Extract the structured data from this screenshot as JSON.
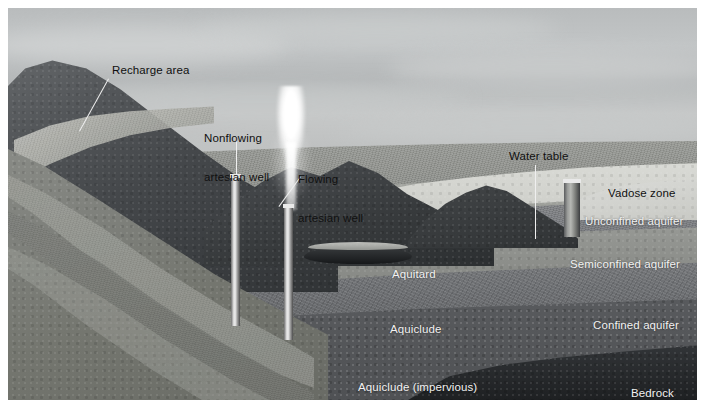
{
  "figure": {
    "kind": "groundwater-cross-section",
    "style": "grayscale-airbrush-illustration",
    "plate_bounds": {
      "left": 8,
      "top": 8,
      "width": 689,
      "height": 392
    }
  },
  "palette": {
    "sky_light": "#c6c8c8",
    "sky_mid": "#b5b8b9",
    "sky_dark": "#a9abab",
    "mountain_dark": "#3f4244",
    "mountain_mid": "#5c5f60",
    "vadose_light": "#cfd0cb",
    "unconfined": "#8d8f8b",
    "semiconfined": "#9b9d98",
    "confined": "#8a8c88",
    "aquitard": "#75777a",
    "aquiclude": "#6b6d70",
    "aquiclude_impervious": "#5e6063",
    "bedrock": "#26282a",
    "label_light": "#f2f2f2",
    "label_dark": "#101010",
    "leader_line": "#efefef",
    "water_dark": "#1d1f21",
    "geyser_white": "#ffffff"
  },
  "labels": {
    "recharge_area": {
      "text": "Recharge area",
      "tone": "dark",
      "x": 104,
      "y": 56,
      "leader": {
        "from_x": 101,
        "from_y": 71,
        "to_x": 72,
        "to_y": 124
      }
    },
    "nonflowing_well": {
      "line1": "Nonflowing",
      "line2": "artesian well",
      "tone": "dark",
      "x": 196,
      "y": 98,
      "leader": {
        "from_x": 228,
        "from_y": 128,
        "to_x": 228,
        "to_y": 168
      }
    },
    "flowing_well": {
      "line1": "Flowing",
      "line2": "artesian well",
      "tone": "dark",
      "x": 290,
      "y": 139,
      "leader": {
        "from_x": 293,
        "from_y": 169,
        "to_x": 271,
        "to_y": 199
      }
    },
    "water_table": {
      "text": "Water table",
      "tone": "dark",
      "x": 501,
      "y": 142,
      "leader": {
        "from_x": 527,
        "from_y": 157,
        "to_x": 527,
        "to_y": 231
      }
    },
    "vadose_zone": {
      "text": "Vadose zone",
      "tone": "dark",
      "x": 600,
      "y": 179
    },
    "unconfined_aquifer": {
      "text": "Unconfined aquifer",
      "tone": "light",
      "x": 577,
      "y": 207
    },
    "semiconfined_aquifer": {
      "text": "Semiconfined aquifer",
      "tone": "light",
      "x": 562,
      "y": 250
    },
    "confined_aquifer": {
      "text": "Confined aquifer",
      "tone": "light",
      "x": 585,
      "y": 311
    },
    "bedrock": {
      "text": "Bedrock",
      "tone": "light",
      "x": 623,
      "y": 379
    },
    "aquitard": {
      "text": "Aquitard",
      "tone": "light",
      "x": 384,
      "y": 260
    },
    "aquiclude": {
      "text": "Aquiclude",
      "tone": "light",
      "x": 382,
      "y": 315
    },
    "aquiclude_impervious": {
      "text": "Aquiclude (impervious)",
      "tone": "light",
      "x": 350,
      "y": 373
    }
  },
  "wells": [
    {
      "name": "nonflowing-artesian-well",
      "x": 223,
      "y": 166,
      "width": 9,
      "height": 152
    },
    {
      "name": "flowing-artesian-well",
      "x": 276,
      "y": 196,
      "width": 9,
      "height": 136
    },
    {
      "name": "water-table-well",
      "x": 556,
      "y": 171,
      "width": 16,
      "height": 58
    }
  ],
  "geyser": {
    "name": "artesian-fountain",
    "x": 266,
    "top": 78,
    "width": 34,
    "height": 124
  },
  "lake": {
    "name": "surface-pond",
    "x": 296,
    "y": 238,
    "width": 108,
    "height": 18
  },
  "strata": [
    {
      "name": "vadose-zone",
      "color": "#cfd0cb"
    },
    {
      "name": "unconfined-aquifer",
      "color": "#8d8f8b"
    },
    {
      "name": "semiconfined-aquifer",
      "color": "#9b9d98"
    },
    {
      "name": "aquitard",
      "color": "#75777a"
    },
    {
      "name": "confined-aquifer",
      "color": "#8a8c88"
    },
    {
      "name": "aquiclude",
      "color": "#6b6d70"
    },
    {
      "name": "aquiclude-impervious",
      "color": "#5e6063"
    },
    {
      "name": "bedrock",
      "color": "#26282a"
    }
  ]
}
